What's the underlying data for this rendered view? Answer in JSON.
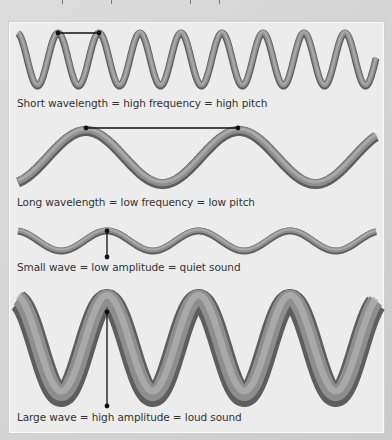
{
  "colors": {
    "background": "#d4d4d4",
    "panel": "#ececec",
    "wave_light": "#a8a8a8",
    "wave_dark": "#555555",
    "marker": "#111111",
    "label_text": "#333333"
  },
  "diagram": {
    "rows": [
      {
        "id": "short-wavelength",
        "label": "Short wavelength = high frequency = high pitch",
        "label_top": 97,
        "wave": {
          "x_start": 18,
          "x_end": 376,
          "peak_x": 58,
          "period": 41,
          "y_top": 33,
          "y_bottom": 86,
          "thickness": 7
        },
        "marker": {
          "type": "horizontal",
          "x1": 58,
          "y1": 33,
          "x2": 99,
          "y2": 33
        }
      },
      {
        "id": "long-wavelength",
        "label": "Long wavelength = low frequency = low pitch",
        "label_top": 196,
        "wave": {
          "x_start": 18,
          "x_end": 376,
          "peak_x": 86,
          "period": 153,
          "y_top": 131,
          "y_bottom": 184,
          "thickness": 10
        },
        "marker": {
          "type": "horizontal",
          "x1": 86,
          "y1": 128,
          "x2": 238,
          "y2": 128
        }
      },
      {
        "id": "small-wave",
        "label": "Small wave = low amplitude = quiet sound",
        "label_top": 261,
        "wave": {
          "x_start": 18,
          "x_end": 376,
          "peak_x": 107,
          "period": 91.5,
          "y_top": 231,
          "y_bottom": 251,
          "thickness": 7
        },
        "marker": {
          "type": "vertical",
          "x1": 107,
          "y1": 231,
          "x2": 107,
          "y2": 257
        }
      },
      {
        "id": "large-wave",
        "label": "Large wave = high amplitude = loud sound",
        "label_top": 411,
        "wave": {
          "x_start": 18,
          "x_end": 376,
          "peak_x": 107,
          "period": 91.5,
          "y_top": 300,
          "y_bottom": 396,
          "thickness": 22
        },
        "marker": {
          "type": "vertical",
          "x1": 107,
          "y1": 312,
          "x2": 107,
          "y2": 406
        }
      }
    ]
  }
}
